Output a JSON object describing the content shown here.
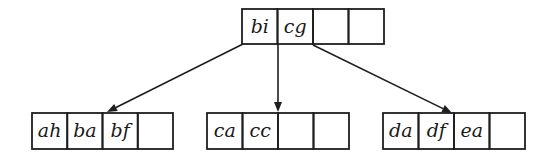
{
  "diagram": {
    "type": "b-tree",
    "colors": {
      "line": "#1e1e1e",
      "text": "#1a1a1a",
      "background": "#ffffff"
    },
    "nodes": [
      {
        "id": "root",
        "x": 242,
        "y": 9,
        "cell_w": 35.5,
        "h": 35,
        "keys": [
          "bi",
          "cg",
          "",
          ""
        ]
      },
      {
        "id": "left",
        "x": 32,
        "y": 113,
        "cell_w": 35.25,
        "h": 36,
        "keys": [
          "ah",
          "ba",
          "bf",
          ""
        ]
      },
      {
        "id": "middle",
        "x": 207,
        "y": 113,
        "cell_w": 35.5,
        "h": 36,
        "keys": [
          "ca",
          "cc",
          "",
          ""
        ]
      },
      {
        "id": "right",
        "x": 383,
        "y": 113,
        "cell_w": 35.5,
        "h": 36,
        "keys": [
          "da",
          "df",
          "ea",
          ""
        ]
      }
    ],
    "edges": [
      {
        "from": "root",
        "to": "left",
        "x1": 243,
        "y1": 44,
        "x2": 107,
        "y2": 112
      },
      {
        "from": "root",
        "to": "middle",
        "x1": 278,
        "y1": 44,
        "x2": 278,
        "y2": 112
      },
      {
        "from": "root",
        "to": "right",
        "x1": 313,
        "y1": 45,
        "x2": 452,
        "y2": 113
      }
    ]
  }
}
